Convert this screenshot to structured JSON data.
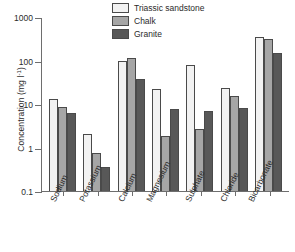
{
  "chart_data": {
    "type": "bar",
    "title": "",
    "subtitle": "",
    "xlabel": "",
    "ylabel": "Concentration (mg l⁻¹)",
    "ylabel_parts": {
      "text": "Concentration (mg l",
      "sup": "-1",
      "tail": ")"
    },
    "yscale": "log",
    "ylim": [
      0.1,
      1000
    ],
    "ytick_labels": [
      "1000",
      "100",
      "10",
      "1",
      "0.1"
    ],
    "ytick_values": [
      1000,
      100,
      10,
      1,
      0.1
    ],
    "grid": false,
    "legend_position": "top-center-right",
    "categories": [
      "Sodium",
      "Potassium",
      "Calcium",
      "Magnesium",
      "Sulphate",
      "Chloride",
      "Bicarbonate"
    ],
    "series": [
      {
        "name": "Triassic sandstone",
        "color": "#f2f2f2",
        "values": [
          13,
          2.0,
          95,
          22,
          80,
          23,
          340
        ]
      },
      {
        "name": "Chalk",
        "color": "#a6a6a6",
        "values": [
          8.5,
          0.75,
          115,
          1.8,
          2.7,
          15,
          310
        ]
      },
      {
        "name": "Granite",
        "color": "#585858",
        "values": [
          6.3,
          0.36,
          37,
          7.5,
          7.0,
          8.3,
          145
        ]
      }
    ]
  },
  "axis": {
    "line_color": "#6e6e6e",
    "bar_edge_color": "#4a4a4a"
  }
}
